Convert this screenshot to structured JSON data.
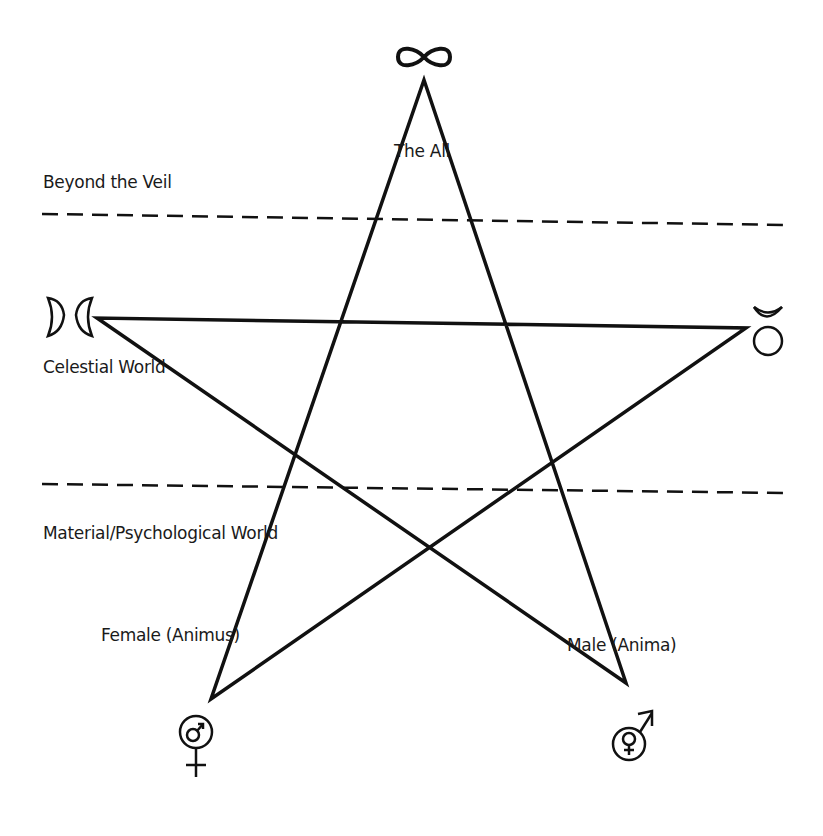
{
  "diagram": {
    "type": "pentagram",
    "stroke_color": "#111111",
    "vertices": {
      "top": [
        424,
        80
      ],
      "left": [
        97,
        318
      ],
      "right": [
        746,
        328
      ],
      "bottom_left": [
        211,
        699
      ],
      "bottom_right": [
        626,
        683
      ]
    },
    "dividers": [
      {
        "name": "veil-divider",
        "y_start": 214,
        "y_end": 225,
        "x_start": 42,
        "x_end": 785
      },
      {
        "name": "world-divider",
        "y_start": 484,
        "y_end": 493,
        "x_start": 42,
        "x_end": 785
      }
    ],
    "labels": {
      "the_all": "The All",
      "beyond_the_veil": "Beyond the Veil",
      "celestial_world": "Celestial World",
      "material_world": "Material/Psychological World",
      "female": "Female (Animus)",
      "male": "Male (Anima)"
    },
    "symbols": {
      "top": "infinity-icon",
      "left": "gemini-moon-icon",
      "right": "taurus-icon",
      "bottom_left": "male-in-female-icon",
      "bottom_right": "female-in-male-icon"
    }
  }
}
